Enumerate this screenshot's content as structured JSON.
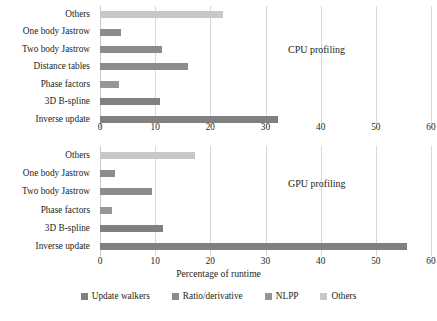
{
  "chart_data": [
    {
      "type": "bar",
      "orientation": "horizontal",
      "title": "CPU profiling",
      "xlabel": "Percentage of runtime",
      "ylabel": "",
      "xlim": [
        0,
        60
      ],
      "xticks": [
        0,
        10,
        20,
        30,
        40,
        50,
        60
      ],
      "grid": true,
      "categories": [
        "Others",
        "One body Jastrow",
        "Two body Jastrow",
        "Distance tables",
        "Phase factors",
        "3D B-spline",
        "Inverse update"
      ],
      "values": [
        22.3,
        3.8,
        11.2,
        16.0,
        3.5,
        10.8,
        32.2
      ],
      "bar_groups": [
        "Others",
        "Ratio/derivative",
        "Ratio/derivative",
        "Ratio/derivative",
        "NLPP",
        "Update walkers",
        "Update walkers"
      ],
      "bar_colors": [
        "#c8c8c8",
        "#8c8c8c",
        "#8c8c8c",
        "#8c8c8c",
        "#969696",
        "#808080",
        "#808080"
      ]
    },
    {
      "type": "bar",
      "orientation": "horizontal",
      "title": "GPU profiling",
      "xlabel": "Percentage of runtime",
      "ylabel": "",
      "xlim": [
        0,
        60
      ],
      "xticks": [
        0,
        10,
        20,
        30,
        40,
        50,
        60
      ],
      "grid": true,
      "categories": [
        "Others",
        "One body Jastrow",
        "Two body Jastrow",
        "Phase factors",
        "3D B-spline",
        "Inverse update"
      ],
      "values": [
        17.3,
        2.7,
        9.4,
        2.1,
        11.5,
        55.7
      ],
      "bar_groups": [
        "Others",
        "Ratio/derivative",
        "Ratio/derivative",
        "NLPP",
        "Update walkers",
        "Update walkers"
      ],
      "bar_colors": [
        "#c8c8c8",
        "#8c8c8c",
        "#8c8c8c",
        "#969696",
        "#808080",
        "#808080"
      ]
    }
  ],
  "axis_title": "Percentage of runtime",
  "legend": {
    "position": "bottom",
    "items": [
      {
        "label": "Update walkers",
        "color": "#808080"
      },
      {
        "label": "Ratio/derivative",
        "color": "#8c8c8c"
      },
      {
        "label": "NLPP",
        "color": "#969696"
      },
      {
        "label": "Others",
        "color": "#c8c8c8"
      }
    ]
  }
}
